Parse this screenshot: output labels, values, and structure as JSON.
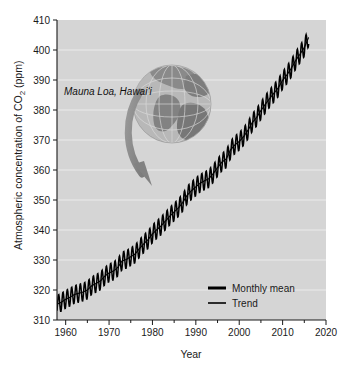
{
  "chart_data": {
    "type": "line",
    "title": "",
    "xlabel": "Year",
    "ylabel": "Atmospheric concentration of CO2 (ppm)",
    "ylabel_parts": {
      "pre": "Atmospheric concentration of CO",
      "sub": "2",
      "post": " (ppm)"
    },
    "xlim": [
      1958,
      2020
    ],
    "ylim": [
      310,
      410
    ],
    "xticks": [
      1960,
      1970,
      1980,
      1990,
      2000,
      2010,
      2020
    ],
    "xtick_labels": [
      "1960",
      "1970",
      "1980",
      "1990",
      "2000",
      "2010",
      "2020"
    ],
    "xminor_ticks": [
      1965,
      1975,
      1985,
      1995,
      2005,
      2015
    ],
    "yticks": [
      310,
      320,
      330,
      340,
      350,
      360,
      370,
      380,
      390,
      400,
      410
    ],
    "ytick_labels": [
      "310",
      "320",
      "330",
      "340",
      "350",
      "360",
      "370",
      "380",
      "390",
      "400",
      "410"
    ],
    "grid": "horizontal-white",
    "plot_bg_color": "#d5d5d5",
    "series_color": "#000000",
    "legend_position": "inside-bottom-right",
    "seasonal_amplitude_ppm": 6,
    "series": [
      {
        "name": "Monthly mean",
        "style": "sawtooth-thick",
        "x": [
          1958,
          1959,
          1960,
          1961,
          1962,
          1963,
          1964,
          1965,
          1966,
          1967,
          1968,
          1969,
          1970,
          1971,
          1972,
          1973,
          1974,
          1975,
          1976,
          1977,
          1978,
          1979,
          1980,
          1981,
          1982,
          1983,
          1984,
          1985,
          1986,
          1987,
          1988,
          1989,
          1990,
          1991,
          1992,
          1993,
          1994,
          1995,
          1996,
          1997,
          1998,
          1999,
          2000,
          2001,
          2002,
          2003,
          2004,
          2005,
          2006,
          2007,
          2008,
          2009,
          2010,
          2011,
          2012,
          2013,
          2014,
          2015,
          2016
        ],
        "values": [
          315.3,
          315.9,
          316.9,
          317.6,
          318.5,
          318.9,
          319.3,
          320.0,
          321.4,
          322.2,
          323.0,
          324.6,
          325.7,
          326.3,
          327.5,
          329.7,
          330.2,
          331.1,
          332.0,
          333.8,
          335.4,
          336.8,
          338.7,
          340.1,
          341.4,
          343.0,
          344.6,
          346.0,
          347.4,
          349.2,
          351.6,
          353.1,
          354.4,
          355.6,
          356.4,
          357.1,
          358.8,
          360.8,
          362.6,
          363.7,
          366.7,
          368.4,
          369.5,
          371.1,
          373.2,
          375.8,
          377.5,
          379.8,
          381.9,
          383.8,
          385.6,
          387.4,
          389.9,
          391.7,
          393.9,
          396.5,
          398.6,
          400.8,
          404.2
        ]
      },
      {
        "name": "Trend",
        "style": "smooth-thin",
        "x": [
          1958,
          1963,
          1968,
          1973,
          1978,
          1983,
          1988,
          1993,
          1998,
          2003,
          2008,
          2013,
          2016
        ],
        "values": [
          315.3,
          318.9,
          323.0,
          329.7,
          335.4,
          343.0,
          351.6,
          357.1,
          366.7,
          375.8,
          385.6,
          396.5,
          403.0
        ]
      }
    ],
    "annotations": [
      {
        "name": "site-label",
        "text": "Mauna Loa, Hawaiʻi",
        "style": "italic"
      }
    ],
    "legend": [
      {
        "label": "Monthly mean",
        "color": "#000000",
        "weight": "thick"
      },
      {
        "label": "Trend",
        "color": "#000000",
        "weight": "thin"
      }
    ],
    "graphics": [
      {
        "name": "globe-image",
        "description": "grayscale globe showing Americas and Atlantic with graticule"
      },
      {
        "name": "curved-arrow",
        "description": "gray curved arrow from globe pointing down-right to the data curve",
        "color": "#8c8c8c"
      }
    ]
  }
}
